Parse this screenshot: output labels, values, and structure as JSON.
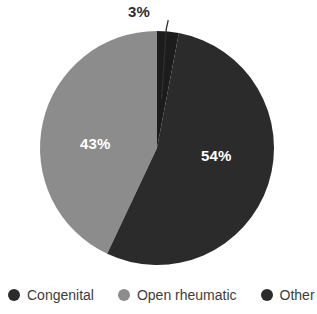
{
  "chart_data": {
    "type": "pie",
    "title": "",
    "subtitle": "",
    "xlabel": "",
    "ylabel": "",
    "legend_position": "bottom",
    "grid": false,
    "unit": "%",
    "categories": [
      "Congenital",
      "Open rheumatic",
      "Other"
    ],
    "values": [
      54,
      43,
      3
    ],
    "slices": [
      {
        "name": "Other",
        "label": "3%",
        "value": 3,
        "color": "#1c1c1c",
        "label_placement": "outside",
        "start_angle_deg": 0,
        "end_angle_deg": 10.8,
        "has_leader_line": true
      },
      {
        "name": "Congenital",
        "label": "54%",
        "value": 54,
        "color": "#2b2b2b",
        "label_placement": "inside",
        "start_angle_deg": 10.8,
        "end_angle_deg": 205.2,
        "has_leader_line": false
      },
      {
        "name": "Open rheumatic",
        "label": "43%",
        "value": 43,
        "color": "#8c8c8c",
        "label_placement": "inside",
        "start_angle_deg": 205.2,
        "end_angle_deg": 360,
        "has_leader_line": false
      }
    ],
    "legend": [
      {
        "label": "Congenital",
        "color": "#2b2b2b"
      },
      {
        "label": "Open rheumatic",
        "color": "#8c8c8c"
      },
      {
        "label": "Other",
        "color": "#2b2b2b"
      }
    ],
    "geometry": {
      "center_x": 157,
      "center_y": 148,
      "radius": 117
    },
    "background_color": "#ffffff"
  }
}
